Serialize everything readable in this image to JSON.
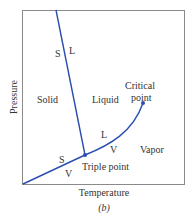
{
  "figure": {
    "type": "phase-diagram",
    "caption": "(b)",
    "x_axis_label": "Temperature",
    "y_axis_label": "Pressure",
    "line_color": "#2a4fb0",
    "frame_color": "#888888",
    "regions": {
      "solid": "Solid",
      "liquid": "Liquid",
      "vapor": "Vapor"
    },
    "points": {
      "critical_line1": "Critical",
      "critical_line2": "point",
      "triple": "Triple point"
    },
    "boundary_labels": {
      "sl_solid": "S",
      "sl_liquid": "L",
      "lv_liquid": "L",
      "lv_vapor": "V",
      "sv_solid": "S",
      "sv_vapor": "V"
    }
  }
}
